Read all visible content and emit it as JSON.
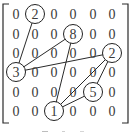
{
  "figure": {
    "type": "sparse-matrix-graph",
    "rows": 6,
    "cols": 6,
    "matrix": [
      [
        "0",
        "2",
        "0",
        "0",
        "0",
        "0"
      ],
      [
        "0",
        "0",
        "0",
        "8",
        "0",
        "0"
      ],
      [
        "0",
        "0",
        "0",
        "0",
        "0",
        "2"
      ],
      [
        "3",
        "0",
        "0",
        "0",
        "0",
        "0"
      ],
      [
        "0",
        "0",
        "0",
        "0",
        "5",
        "0"
      ],
      [
        "0",
        "0",
        "1",
        "0",
        "0",
        "0"
      ]
    ],
    "circled_nodes": [
      {
        "id": "n2a",
        "row": 0,
        "col": 1,
        "value": "2"
      },
      {
        "id": "n8",
        "row": 1,
        "col": 3,
        "value": "8"
      },
      {
        "id": "n2b",
        "row": 2,
        "col": 5,
        "value": "2"
      },
      {
        "id": "n3",
        "row": 3,
        "col": 0,
        "value": "3"
      },
      {
        "id": "n5",
        "row": 4,
        "col": 4,
        "value": "5"
      },
      {
        "id": "n1",
        "row": 5,
        "col": 2,
        "value": "1"
      }
    ],
    "edges": [
      [
        "n2a",
        "n3"
      ],
      [
        "n8",
        "n3"
      ],
      [
        "n2b",
        "n3"
      ],
      [
        "n8",
        "n1"
      ],
      [
        "n2b",
        "n1"
      ],
      [
        "n2b",
        "n5"
      ],
      [
        "n5",
        "n1"
      ]
    ],
    "caption_visible": false
  }
}
